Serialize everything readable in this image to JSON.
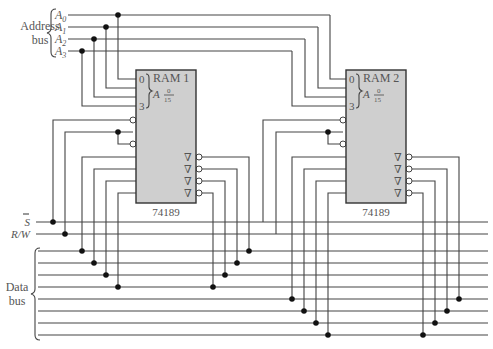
{
  "address_bus": {
    "label_line1": "Address",
    "label_line2": "bus",
    "lines": [
      "A0",
      "A1",
      "A2",
      "A3"
    ],
    "line_labels": [
      {
        "base": "A",
        "sub": "0"
      },
      {
        "base": "A",
        "sub": "1"
      },
      {
        "base": "A",
        "sub": "2"
      },
      {
        "base": "A",
        "sub": "3"
      }
    ]
  },
  "control": {
    "select_label": "S",
    "rw_label": "R/W"
  },
  "data_bus": {
    "label_line1": "Data",
    "label_line2": "bus",
    "line_count": 8
  },
  "chips": [
    {
      "name": "RAM 1",
      "part": "74189",
      "addr_top": "0",
      "addr_bottom": "3",
      "addr_letter": "A",
      "range_top": "0",
      "range_bottom": "15",
      "output_symbol": "∇"
    },
    {
      "name": "RAM 2",
      "part": "74189",
      "addr_top": "0",
      "addr_bottom": "3",
      "addr_letter": "A",
      "range_top": "0",
      "range_bottom": "15",
      "output_symbol": "∇"
    }
  ],
  "colors": {
    "chip_fill": "#cfcfcf",
    "wire": "#444444",
    "text": "#555555"
  }
}
